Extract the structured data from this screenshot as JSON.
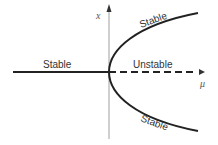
{
  "diagram": {
    "type": "pitchfork-bifurcation",
    "axes": {
      "vertical_label": "x",
      "horizontal_label": "μ"
    },
    "branches": [
      {
        "id": "left-trivial",
        "label": "Stable",
        "style": "solid"
      },
      {
        "id": "right-trivial",
        "label": "Unstable",
        "style": "dashed"
      },
      {
        "id": "upper-branch",
        "label": "Stable",
        "style": "solid"
      },
      {
        "id": "lower-branch",
        "label": "Stable",
        "style": "solid"
      }
    ],
    "colors": {
      "curve": "#222222",
      "axis": "#999999",
      "text": "#333333"
    }
  }
}
